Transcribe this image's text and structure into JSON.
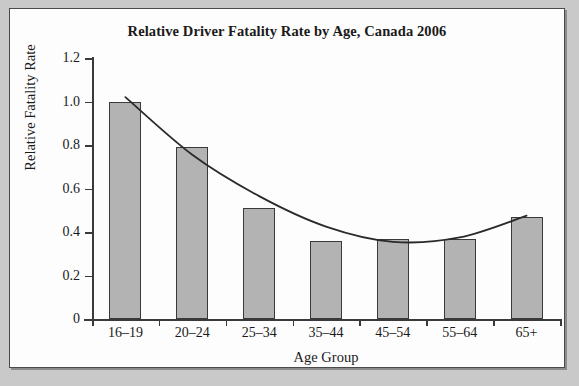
{
  "chart_data": {
    "type": "bar",
    "title": "Relative Driver Fatality Rate by Age, Canada 2006",
    "xlabel": "Age Group",
    "ylabel": "Relative Fatality Rate",
    "categories": [
      "16–19",
      "20–24",
      "25–34",
      "35–44",
      "45–54",
      "55–64",
      "65+"
    ],
    "values": [
      1.0,
      0.79,
      0.51,
      0.36,
      0.37,
      0.37,
      0.47
    ],
    "ylim": [
      0,
      1.2
    ],
    "ytick_labels": [
      "0",
      "0.2",
      "0.4",
      "0.6",
      "0.8",
      "1.0",
      "1.2"
    ],
    "ytick_values": [
      0,
      0.2,
      0.4,
      0.6,
      0.8,
      1.0,
      1.2
    ],
    "grid": false,
    "legend": "none",
    "series": [
      {
        "name": "Relative Fatality Rate",
        "values": [
          1.0,
          0.79,
          0.51,
          0.36,
          0.37,
          0.37,
          0.47
        ]
      },
      {
        "name": "fitted trend curve",
        "type": "line",
        "values": [
          1.02,
          0.755,
          0.565,
          0.425,
          0.355,
          0.375,
          0.475
        ]
      }
    ],
    "colors": {
      "bar_fill": "#b3b3b3",
      "bar_edge": "#3a3a3a",
      "curve": "#2a2a2a",
      "panel_background": "#fdfdfd",
      "page_background": "#c9c9c9",
      "text": "#1a1a1a"
    }
  }
}
